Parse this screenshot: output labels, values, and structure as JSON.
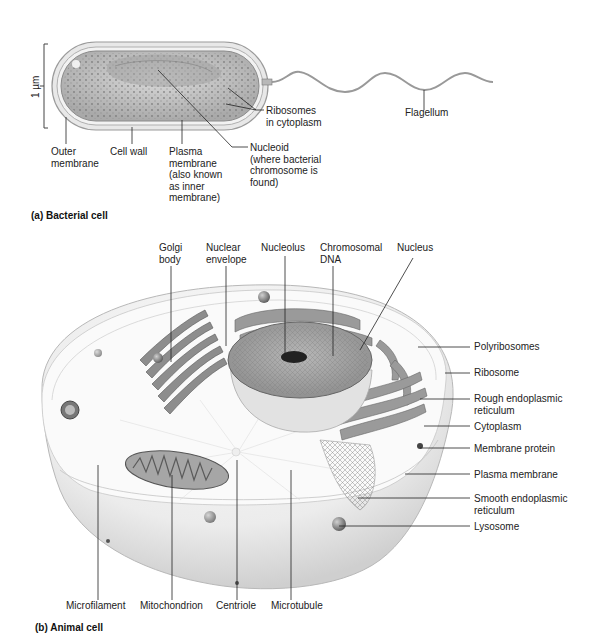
{
  "bacterial": {
    "caption": "(a) Bacterial cell",
    "scale": "1 µm",
    "labels": {
      "outer_membrane": "Outer\nmembrane",
      "cell_wall": "Cell wall",
      "plasma_membrane": "Plasma\nmembrane\n(also known\nas inner\nmembrane)",
      "nucleoid": "Nucleoid\n(where bacterial\nchromosome is\nfound)",
      "ribosomes": "Ribosomes\nin cytoplasm",
      "flagellum": "Flagellum"
    }
  },
  "animal": {
    "caption": "(b) Animal cell",
    "top_labels": {
      "golgi": "Golgi\nbody",
      "nuclear_envelope": "Nuclear\nenvelope",
      "nucleolus": "Nucleolus",
      "chromosomal_dna": "Chromosomal\nDNA",
      "nucleus": "Nucleus"
    },
    "right_labels": {
      "polyribosomes": "Polyribosomes",
      "ribosome": "Ribosome",
      "rough_er": "Rough endoplasmic\nreticulum",
      "cytoplasm": "Cytoplasm",
      "membrane_protein": "Membrane protein",
      "plasma_membrane": "Plasma membrane",
      "smooth_er": "Smooth endoplasmic\nreticulum",
      "lysosome": "Lysosome"
    },
    "bottom_labels": {
      "microfilament": "Microfilament",
      "mitochondrion": "Mitochondrion",
      "centriole": "Centriole",
      "microtubule": "Microtubule"
    }
  },
  "colors": {
    "cell_fill": "#e6e6e6",
    "organelle": "#8a8a8a",
    "line": "#333333"
  }
}
